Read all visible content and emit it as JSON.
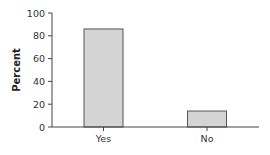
{
  "chart_data": {
    "type": "bar",
    "title": "",
    "xlabel": "",
    "ylabel": "Percent",
    "categories": [
      "Yes",
      "No"
    ],
    "values": [
      86,
      14
    ],
    "ylim": [
      0,
      100
    ],
    "yticks": [
      0,
      20,
      40,
      60,
      80,
      100
    ],
    "grid": false,
    "legend": null,
    "bar_color": "#d4d4d4",
    "bar_edge_color": "#555555"
  }
}
